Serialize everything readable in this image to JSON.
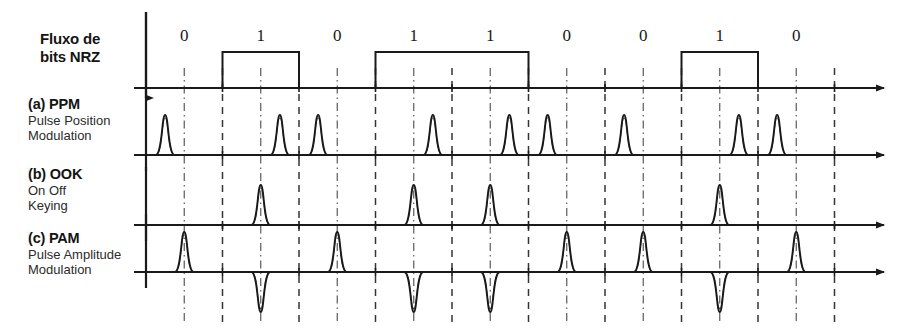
{
  "figure": {
    "title_labels": {
      "nrz": {
        "heading": "Fluxo de",
        "heading2": "bits NRZ"
      },
      "ppm": {
        "heading": "(a) PPM",
        "line1": "Pulse Position",
        "line2": "Modulation"
      },
      "ook": {
        "heading": "(b) OOK",
        "line1": "On Off",
        "line2": "Keying"
      },
      "pam": {
        "heading": "(c) PAM",
        "line1": "Pulse Amplitude",
        "line2": "Modulation"
      }
    },
    "colors": {
      "line": "#1a1a1a",
      "guide": "#3a3a3a",
      "background": "#ffffff"
    }
  },
  "chart_data": {
    "type": "line",
    "xlabel": "",
    "ylabel": "",
    "bit_labels": [
      "0",
      "1",
      "0",
      "1",
      "1",
      "0",
      "0",
      "1",
      "0"
    ],
    "bits": [
      0,
      1,
      0,
      1,
      1,
      0,
      0,
      1,
      0
    ],
    "bit_count": 9,
    "grid": false,
    "legend": "none",
    "geometry": {
      "x_origin": 146,
      "bit_width": 76.5,
      "axis_end": 884
    },
    "series": [
      {
        "name": "Fluxo de bits NRZ",
        "type": "nrz",
        "baseline_y": 88,
        "high_y": 52,
        "values": [
          0,
          1,
          0,
          1,
          1,
          0,
          0,
          1,
          0
        ]
      },
      {
        "name": "(a) PPM",
        "type": "ppm",
        "baseline_y": 155,
        "pulse_height": 40,
        "description": "pulse in first half of bit slot for 0, second half for 1",
        "pulse_positions": [
          0.25,
          0.75,
          0.25,
          0.75,
          0.75,
          0.25,
          0.25,
          0.75,
          0.25
        ],
        "pulse_polarity": [
          1,
          1,
          1,
          1,
          1,
          1,
          1,
          1,
          1
        ]
      },
      {
        "name": "(b) OOK",
        "type": "ook",
        "baseline_y": 225,
        "pulse_height": 40,
        "description": "pulse at bit centre only when bit is 1",
        "pulse_positions": [
          null,
          0.5,
          null,
          0.5,
          0.5,
          null,
          null,
          0.5,
          null
        ],
        "pulse_polarity": [
          0,
          1,
          0,
          1,
          1,
          0,
          0,
          1,
          0
        ]
      },
      {
        "name": "(c) PAM",
        "type": "pam",
        "baseline_y": 272,
        "pulse_height": 40,
        "description": "positive pulse at bit centre for 0, negative pulse for 1",
        "pulse_positions": [
          0.5,
          0.5,
          0.5,
          0.5,
          0.5,
          0.5,
          0.5,
          0.5,
          0.5
        ],
        "pulse_polarity": [
          1,
          -1,
          1,
          -1,
          -1,
          1,
          1,
          -1,
          1
        ]
      }
    ]
  }
}
